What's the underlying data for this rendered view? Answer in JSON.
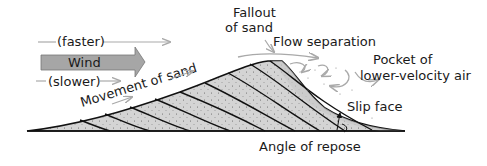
{
  "diagram": {
    "type": "sand-dune-cross-section",
    "labels": {
      "faster": "(faster)",
      "wind": "Wind",
      "slower": "(slower)",
      "movement": "Movement of sand",
      "fallout_line1": "Fallout",
      "fallout_line2": "of sand",
      "flow_separation": "Flow separation",
      "pocket_line1": "Pocket of",
      "pocket_line2": "lower-velocity air",
      "slip_face": "Slip face",
      "angle_of_repose": "Angle of repose"
    },
    "colors": {
      "sand_fill": "#d4d4d4",
      "wind_arrow_fill": "#a6a6a6",
      "flow_arrows": "#a9a9a9",
      "outline": "#111111"
    }
  }
}
